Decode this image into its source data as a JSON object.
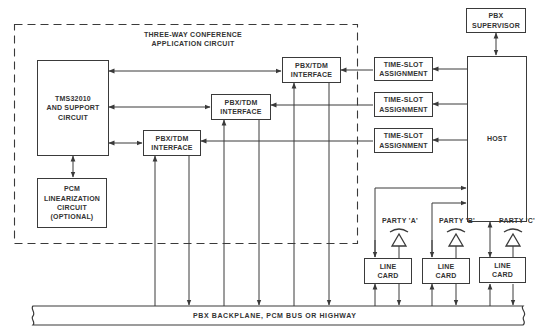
{
  "diagram": {
    "type": "block-diagram",
    "container": {
      "label_line1": "THREE-WAY CONFERENCE",
      "label_line2": "APPLICATION CIRCUIT",
      "style": "dashed"
    },
    "blocks": {
      "dsp": {
        "line1": "TMS32010",
        "line2": "AND SUPPORT",
        "line3": "CIRCUIT"
      },
      "pcm_linearization": {
        "line1": "PCM",
        "line2": "LINEARIZATION",
        "line3": "CIRCUIT",
        "line4": "(OPTIONAL)"
      },
      "pbx_tdm_1": {
        "line1": "PBX/TDM",
        "line2": "INTERFACE"
      },
      "pbx_tdm_2": {
        "line1": "PBX/TDM",
        "line2": "INTERFACE"
      },
      "pbx_tdm_3": {
        "line1": "PBX/TDM",
        "line2": "INTERFACE"
      },
      "time_slot_1": {
        "line1": "TIME-SLOT",
        "line2": "ASSIGNMENT"
      },
      "time_slot_2": {
        "line1": "TIME-SLOT",
        "line2": "ASSIGNMENT"
      },
      "time_slot_3": {
        "line1": "TIME-SLOT",
        "line2": "ASSIGNMENT"
      },
      "pbx_supervisor": {
        "line1": "PBX",
        "line2": "SUPERVISOR"
      },
      "host": {
        "line1": "HOST"
      },
      "line_card_a": {
        "line1": "LINE",
        "line2": "CARD"
      },
      "line_card_b": {
        "line1": "LINE",
        "line2": "CARD"
      },
      "line_card_c": {
        "line1": "LINE",
        "line2": "CARD"
      }
    },
    "parties": {
      "a": "PARTY 'A'",
      "b": "PARTY 'B'",
      "c": "PARTY 'C'"
    },
    "bus": {
      "label": "PBX BACKPLANE, PCM BUS OR HIGHWAY"
    },
    "connections": [
      {
        "from": "dsp",
        "to": "pbx_tdm_1",
        "direction": "bidirectional"
      },
      {
        "from": "dsp",
        "to": "pbx_tdm_2",
        "direction": "bidirectional"
      },
      {
        "from": "dsp",
        "to": "pbx_tdm_3",
        "direction": "bidirectional"
      },
      {
        "from": "dsp",
        "to": "pcm_linearization",
        "direction": "bidirectional"
      },
      {
        "from": "time_slot_1",
        "to": "pbx_tdm_1",
        "direction": "forward"
      },
      {
        "from": "time_slot_2",
        "to": "pbx_tdm_2",
        "direction": "forward"
      },
      {
        "from": "time_slot_3",
        "to": "pbx_tdm_3",
        "direction": "forward"
      },
      {
        "from": "host",
        "to": "time_slot_1",
        "direction": "forward"
      },
      {
        "from": "host",
        "to": "time_slot_2",
        "direction": "forward"
      },
      {
        "from": "host",
        "to": "time_slot_3",
        "direction": "forward"
      },
      {
        "from": "pbx_supervisor",
        "to": "host",
        "direction": "bidirectional"
      },
      {
        "from": "line_card_a",
        "to": "host",
        "direction": "forward"
      },
      {
        "from": "line_card_b",
        "to": "host",
        "direction": "forward"
      },
      {
        "from": "host",
        "to": "line_card_c",
        "direction": "bidirectional"
      },
      {
        "from": "bus",
        "to": "pbx_tdm_1",
        "direction": "forward"
      },
      {
        "from": "bus",
        "to": "pbx_tdm_2",
        "direction": "forward"
      },
      {
        "from": "bus",
        "to": "pbx_tdm_3",
        "direction": "forward"
      },
      {
        "from": "pbx_tdm_1",
        "to": "bus",
        "direction": "forward"
      },
      {
        "from": "pbx_tdm_2",
        "to": "bus",
        "direction": "forward"
      },
      {
        "from": "pbx_tdm_3",
        "to": "bus",
        "direction": "forward"
      },
      {
        "from": "bus",
        "to": "line_card_a",
        "direction": "forward"
      },
      {
        "from": "line_card_a",
        "to": "bus",
        "direction": "forward"
      },
      {
        "from": "bus",
        "to": "line_card_b",
        "direction": "forward"
      },
      {
        "from": "line_card_b",
        "to": "bus",
        "direction": "forward"
      },
      {
        "from": "bus",
        "to": "line_card_c",
        "direction": "forward"
      },
      {
        "from": "line_card_c",
        "to": "bus",
        "direction": "forward"
      }
    ]
  }
}
